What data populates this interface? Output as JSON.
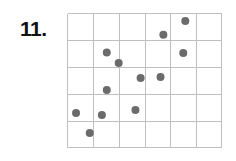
{
  "figure": {
    "problem_number": "11.",
    "colors": {
      "background": "#ffffff",
      "label_text": "#111111",
      "grid_line": "#bfbfbf",
      "data_point": "#6b6b6b"
    }
  },
  "chart_data": {
    "type": "scatter",
    "title": "",
    "subtitle": "",
    "xlabel": "",
    "ylabel": "",
    "grid": true,
    "grid_columns": 6,
    "grid_rows": 5,
    "legend": null,
    "legend_position": "none",
    "xlim": [
      0,
      6
    ],
    "ylim": [
      0,
      5
    ],
    "xticks": [
      0,
      1,
      2,
      3,
      4,
      5,
      6
    ],
    "yticks": [
      0,
      1,
      2,
      3,
      4,
      5
    ],
    "xtick_labels": [
      "",
      "",
      "",
      "",
      "",
      "",
      ""
    ],
    "ytick_labels": [
      "",
      "",
      "",
      "",
      "",
      ""
    ],
    "annotations": [],
    "point_count": 12,
    "point_radius": 4,
    "series": [
      {
        "name": "data",
        "color": "#6b6b6b",
        "points": [
          {
            "x": 4.58,
            "y": 4.7
          },
          {
            "x": 3.73,
            "y": 4.19
          },
          {
            "x": 1.54,
            "y": 3.54
          },
          {
            "x": 4.5,
            "y": 3.52
          },
          {
            "x": 2.0,
            "y": 3.15
          },
          {
            "x": 2.85,
            "y": 2.59
          },
          {
            "x": 3.62,
            "y": 2.63
          },
          {
            "x": 1.54,
            "y": 2.15
          },
          {
            "x": 2.65,
            "y": 1.41
          },
          {
            "x": 0.35,
            "y": 1.3
          },
          {
            "x": 1.35,
            "y": 1.22
          },
          {
            "x": 0.88,
            "y": 0.56
          }
        ]
      }
    ]
  }
}
